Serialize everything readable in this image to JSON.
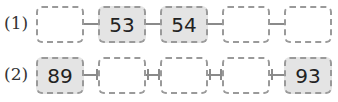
{
  "rows": [
    {
      "label": "(1)",
      "boxes": [
        {
          "value": "",
          "filled": false
        },
        {
          "value": "53",
          "filled": true
        },
        {
          "value": "54",
          "filled": true
        },
        {
          "value": "",
          "filled": false
        },
        {
          "value": "",
          "filled": false
        }
      ]
    },
    {
      "label": "(2)",
      "boxes": [
        {
          "value": "89",
          "filled": true
        },
        {
          "value": "",
          "filled": false
        },
        {
          "value": "",
          "filled": false
        },
        {
          "value": "",
          "filled": false
        },
        {
          "value": "93",
          "filled": true
        }
      ]
    }
  ],
  "colors": {
    "filled_box": "#e4e4e4",
    "empty_box": "#ffffff",
    "dashed_border": "#9a9a9a"
  }
}
